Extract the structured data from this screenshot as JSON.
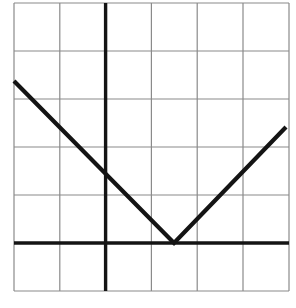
{
  "figure": {
    "title": "",
    "background_color": "#ffffff",
    "width": 296,
    "height": 308
  },
  "grid": {
    "columns": 6,
    "rows": 6,
    "x_min_px": 14,
    "x_max_px": 289,
    "y_min_px": 3,
    "y_max_px": 291,
    "line_color": "#8a8a8a",
    "line_width_px": 1.2,
    "x_gridlines_px": [
      14,
      59.8,
      105.6,
      151.4,
      197.2,
      243,
      289
    ],
    "y_gridlines_px": [
      3,
      51,
      99,
      147,
      195,
      243,
      291
    ]
  },
  "axes": {
    "color": "#141414",
    "line_width_px": 3.4,
    "y_axis": {
      "name": "y-axis",
      "x_px": 105.6,
      "y_start_px": 3,
      "y_end_px": 291
    },
    "x_axis": {
      "name": "x-axis",
      "y_px": 243,
      "x_start_px": 14,
      "x_end_px": 289
    },
    "origin_px": [
      105.6,
      243
    ]
  },
  "chart_data": {
    "type": "line",
    "title": "",
    "xlabel": "",
    "ylabel": "",
    "xlim": [
      -2,
      4
    ],
    "ylim": [
      -1,
      5
    ],
    "grid": true,
    "legend": null,
    "series": [
      {
        "name": "v-shape-curve",
        "color": "#141414",
        "line_width_px": 4.2,
        "x": [
          -2,
          1.5,
          4
        ],
        "y": [
          3.375,
          0,
          2.4
        ],
        "points_px": [
          [
            14,
            81
          ],
          [
            174,
            243
          ],
          [
            286,
            127
          ]
        ],
        "segments": [
          {
            "name": "descending-segment",
            "from_px": [
              14,
              81
            ],
            "to_px": [
              174,
              243
            ],
            "from": [
              -2,
              3.375
            ],
            "to": [
              1.5,
              0
            ],
            "slope": -0.964
          },
          {
            "name": "ascending-segment",
            "from_px": [
              174,
              243
            ],
            "to_px": [
              286,
              127
            ],
            "from": [
              1.5,
              0
            ],
            "to": [
              4,
              2.4
            ],
            "slope": 0.96
          }
        ]
      }
    ],
    "vertex": {
      "label": "",
      "x": 1.5,
      "y": 0,
      "px": [
        174,
        243
      ]
    }
  }
}
